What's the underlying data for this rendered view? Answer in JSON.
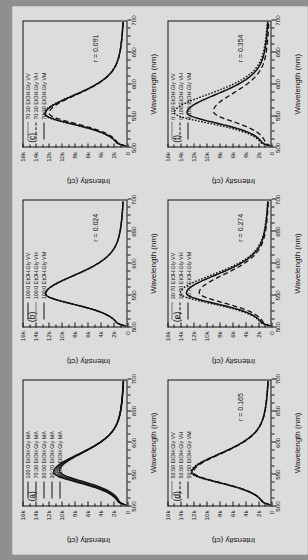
{
  "figure": {
    "rotation_note": "figure displayed rotated 90 degrees counter-clockwise",
    "background_color": "#dcdcdc",
    "line_color": "#111111"
  },
  "axis": {
    "xlabel": "Wavelength (nm)",
    "ylabel_ct": "Intensity (ct)",
    "ylabel_a": "Intensity (a)",
    "xticklabels": [
      "500",
      "550",
      "600",
      "650",
      "700"
    ],
    "yticklabels": [
      "0",
      "2k",
      "4k",
      "6k",
      "8k",
      "10k",
      "12k",
      "14k",
      "16k"
    ]
  },
  "chart_data": {
    "type": "line",
    "title": "",
    "xlabel": "Wavelength (nm)",
    "ylabel": "Intensity (ct)",
    "xlim": [
      500,
      700
    ],
    "ylim": [
      0,
      16000
    ],
    "xticks": [
      500,
      550,
      600,
      650,
      700
    ],
    "yticks": [
      0,
      2000,
      4000,
      6000,
      8000,
      10000,
      12000,
      14000,
      16000
    ],
    "grid": false,
    "legend_position": "upper-left",
    "panels": [
      {
        "letter": "(a)",
        "ylabel": "Intensity (ct)",
        "r_label": "",
        "series": [
          {
            "name": "100:0 EtOH:Gly MA",
            "style": "solid",
            "peak_nm": 553,
            "peak_ct": 11300
          },
          {
            "name": "70:30 EtOH:Gly MA",
            "style": "solid-thin",
            "peak_nm": 553,
            "peak_ct": 11050
          },
          {
            "name": "50:50 EtOH:Gly MA",
            "style": "solid-thin",
            "peak_nm": 554,
            "peak_ct": 10900
          },
          {
            "name": "30:70 EtOH:Gly MA",
            "style": "solid-thin",
            "peak_nm": 554,
            "peak_ct": 10700
          },
          {
            "name": "0:100 EtOH:Gly MA",
            "style": "solid",
            "peak_nm": 555,
            "peak_ct": 10400
          }
        ]
      },
      {
        "letter": "(b)",
        "ylabel": "Intensity (ct)",
        "r_label": "r = 0.024",
        "series": [
          {
            "name": "100:0 EtOH:Gly VV",
            "style": "solid-thin",
            "peak_nm": 552,
            "peak_ct": 12600
          },
          {
            "name": "100:0 EtOH:Gly VH",
            "style": "dot",
            "peak_nm": 552,
            "peak_ct": 12500
          },
          {
            "name": "100:0 EtOH:Gly VM",
            "style": "solid",
            "peak_nm": 552,
            "peak_ct": 12550
          }
        ]
      },
      {
        "letter": "(c)",
        "ylabel": "Intensity (ct)",
        "r_label": "r = 0.091",
        "series": [
          {
            "name": "70:30 EtOH:Gly VV",
            "style": "dot",
            "peak_nm": 552,
            "peak_ct": 12800
          },
          {
            "name": "70:30 EtOH:Gly VH",
            "style": "dash",
            "peak_nm": 553,
            "peak_ct": 12000
          },
          {
            "name": "70:30 EtOH:Gly VM",
            "style": "solid",
            "peak_nm": 552,
            "peak_ct": 12600
          }
        ]
      },
      {
        "letter": "(d)",
        "ylabel": "Intensity (ct)",
        "r_label": "r = 0.165",
        "series": [
          {
            "name": "50:50 EtOH:Gly VV",
            "style": "dot",
            "peak_nm": 553,
            "peak_ct": 12500
          },
          {
            "name": "50:50 EtOH:Gly VH",
            "style": "dash",
            "peak_nm": 553,
            "peak_ct": 12100
          },
          {
            "name": "50:50 EtOH:Gly VM",
            "style": "solid",
            "peak_nm": 553,
            "peak_ct": 12350
          }
        ]
      },
      {
        "letter": "(e)",
        "ylabel": "Intensity (ct)",
        "r_label": "r = 0.274",
        "series": [
          {
            "name": "30:70 EtOH:Gly VV",
            "style": "dot",
            "peak_nm": 553,
            "peak_ct": 14200
          },
          {
            "name": "30:70 EtOH:Gly VH",
            "style": "dash",
            "peak_nm": 554,
            "peak_ct": 11200
          },
          {
            "name": "30:70 EtOH:Gly VM",
            "style": "solid",
            "peak_nm": 553,
            "peak_ct": 13200
          }
        ]
      },
      {
        "letter": "(f)",
        "ylabel": "Intensity (ct)",
        "r_label": "r = 0.354",
        "series": [
          {
            "name": "0:100 EtOH:Gly VV",
            "style": "dot",
            "peak_nm": 554,
            "peak_ct": 15100
          },
          {
            "name": "0:100 EtOH:Gly VH",
            "style": "dash",
            "peak_nm": 556,
            "peak_ct": 9000
          },
          {
            "name": "0:100 EtOH:Gly VM",
            "style": "solid",
            "peak_nm": 554,
            "peak_ct": 13100
          }
        ]
      }
    ]
  }
}
